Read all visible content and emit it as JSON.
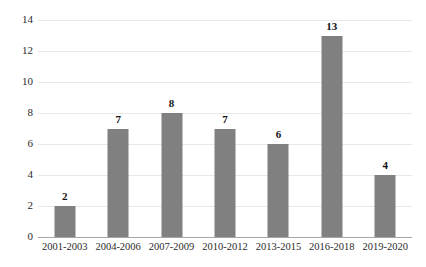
{
  "chart_data": {
    "type": "bar",
    "title": "",
    "subtitle": "",
    "xlabel": "",
    "ylabel": "",
    "categories": [
      "2001-2003",
      "2004-2006",
      "2007-2009",
      "2010-2012",
      "2013-2015",
      "2016-2018",
      "2019-2020"
    ],
    "values": [
      2,
      7,
      8,
      7,
      6,
      13,
      4
    ],
    "data_labels": [
      "2",
      "7",
      "8",
      "7",
      "6",
      "13",
      "4"
    ],
    "ylim": [
      0,
      14
    ],
    "ytick_values": [
      0,
      2,
      4,
      6,
      8,
      10,
      12,
      14
    ],
    "ytick_labels": [
      "0",
      "2",
      "4",
      "6",
      "8",
      "10",
      "12",
      "14"
    ],
    "grid": true,
    "grid_axis": "y",
    "legend": false,
    "legend_position": "none",
    "colors": {
      "bar": "#808080",
      "gridline": "#e8e8e8",
      "axis_line": "#a6a6a6",
      "tick_text": "#2b2b2b",
      "data_label_text": "#111111",
      "background": "#ffffff"
    }
  }
}
